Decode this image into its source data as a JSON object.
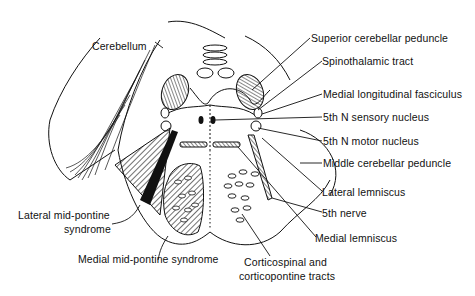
{
  "figure": {
    "labels": {
      "cerebellum": "Cerebellum",
      "superior_cerebellar_peduncle": "Superior cerebellar peduncle",
      "spinothalamic_tract": "Spinothalamic tract",
      "medial_longitudinal_fasciculus": "Medial longitudinal fasciculus",
      "sensory_nucleus_5th": "5th N sensory nucleus",
      "motor_nucleus_5th": "5th N motor nucleus",
      "middle_cerebellar_peduncle": "Middle cerebellar peduncle",
      "lateral_lemniscus": "Lateral lemniscus",
      "fifth_nerve": "5th nerve",
      "medial_lemniscus": "Medial lemniscus",
      "corticospinal_line1": "Corticospinal and",
      "corticospinal_line2": "corticopontine tracts",
      "lateral_syndrome_line1": "Lateral mid-pontine",
      "lateral_syndrome_line2": "syndrome",
      "medial_syndrome": "Medial mid-pontine syndrome"
    },
    "colors": {
      "ink": "#111111",
      "background": "#ffffff"
    }
  }
}
